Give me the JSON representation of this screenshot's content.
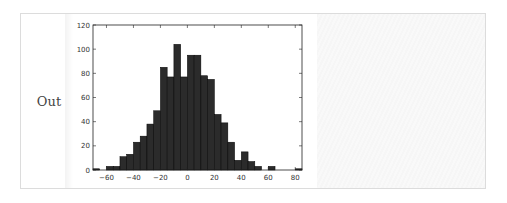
{
  "cell": {
    "prompt_label": "Out"
  },
  "chart_data": {
    "type": "bar",
    "title": "",
    "xlabel": "",
    "ylabel": "",
    "xlim": [
      -70,
      85
    ],
    "ylim": [
      0,
      120
    ],
    "bin_width": 5,
    "bin_edges_start": [
      -70,
      -65,
      -60,
      -55,
      -50,
      -45,
      -40,
      -35,
      -30,
      -25,
      -20,
      -15,
      -10,
      -5,
      0,
      5,
      10,
      15,
      20,
      25,
      30,
      35,
      40,
      45,
      50,
      55,
      60,
      65,
      70,
      75,
      80
    ],
    "values": [
      1,
      0,
      3,
      3,
      11,
      13,
      23,
      28,
      38,
      49,
      85,
      77,
      104,
      77,
      95,
      95,
      78,
      75,
      46,
      39,
      23,
      8,
      15,
      7,
      3,
      0,
      3,
      0,
      0,
      0,
      1
    ],
    "xticks": [
      -60,
      -40,
      -20,
      0,
      20,
      40,
      60,
      80
    ],
    "xtick_labels": [
      "−60",
      "−40",
      "−20",
      "0",
      "20",
      "40",
      "60",
      "80"
    ],
    "yticks": [
      0,
      20,
      40,
      60,
      80,
      100,
      120
    ],
    "ytick_labels": [
      "0",
      "20",
      "40",
      "60",
      "80",
      "100",
      "120"
    ],
    "grid": false,
    "legend": null,
    "bar_color": "#2b2b2b",
    "edge_color": "#000000"
  }
}
